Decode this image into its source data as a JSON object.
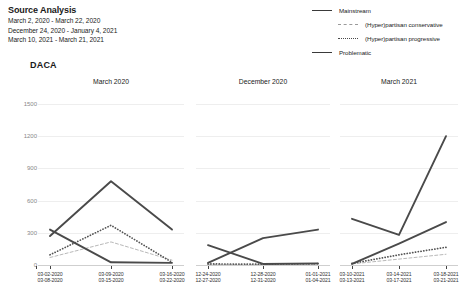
{
  "header": {
    "title": "Source Analysis",
    "date_ranges": [
      "March 2, 2020 - March 22, 2020",
      "December 24, 2020 - January 4, 2021",
      "March 10, 2021 - March 21, 2021"
    ]
  },
  "legend": {
    "items": [
      {
        "label": "Mainstream",
        "style": "solid",
        "color": "#3a3a3a",
        "indent": false
      },
      {
        "label": "(Hyper)partisan conservative",
        "style": "dash",
        "color": "#9a9a9a",
        "indent": true
      },
      {
        "label": "(Hyper)partisan progressive",
        "style": "dot",
        "color": "#4a4a4a",
        "indent": true
      },
      {
        "label": "Problematic",
        "style": "solid",
        "color": "#3a3a3a",
        "indent": false
      }
    ]
  },
  "chart_data": {
    "type": "line",
    "title": "DACA",
    "xlabel": "",
    "ylabel": "",
    "ylim": [
      0,
      1500
    ],
    "yticks": [
      0,
      300,
      600,
      900,
      1200,
      1500
    ],
    "grid": true,
    "legend_position": "top-right",
    "panels": [
      {
        "title": "March 2020",
        "x": [
          "03-02-2020\n03-08-2020",
          "03-09-2020\n03-15-2020",
          "03-16-2020\n03-22-2020"
        ],
        "xticks": [
          {
            "line1": "03-02-2020",
            "line2": "03-08-2020"
          },
          {
            "line1": "03-09-2020",
            "line2": "03-15-2020"
          },
          {
            "line1": "03-16-2020",
            "line2": "03-22-2020"
          }
        ],
        "series": [
          {
            "name": "Mainstream",
            "style": "solid",
            "color": "#4a4a4a",
            "values": [
              270,
              780,
              330
            ]
          },
          {
            "name": "(Hyper)partisan conservative",
            "style": "dash",
            "color": "#b0b0b0",
            "values": [
              70,
              215,
              45
            ]
          },
          {
            "name": "(Hyper)partisan progressive",
            "style": "dot",
            "color": "#555555",
            "values": [
              95,
              370,
              25
            ]
          },
          {
            "name": "Problematic",
            "style": "solid",
            "color": "#4a4a4a",
            "values": [
              330,
              25,
              20
            ]
          }
        ]
      },
      {
        "title": "December 2020",
        "x": [
          "12-24-2020\n12-27-2020",
          "12-28-2020\n12-31-2020",
          "01-01-2021\n01-04-2021"
        ],
        "xticks": [
          {
            "line1": "12-24-2020",
            "line2": "12-27-2020"
          },
          {
            "line1": "12-28-2020",
            "line2": "12-31-2020"
          },
          {
            "line1": "01-01-2021",
            "line2": "01-04-2021"
          }
        ],
        "series": [
          {
            "name": "Mainstream",
            "style": "solid",
            "color": "#4a4a4a",
            "values": [
              20,
              250,
              330
            ]
          },
          {
            "name": "(Hyper)partisan conservative",
            "style": "dash",
            "color": "#b0b0b0",
            "values": [
              5,
              5,
              5
            ]
          },
          {
            "name": "(Hyper)partisan progressive",
            "style": "dot",
            "color": "#555555",
            "values": [
              10,
              8,
              12
            ]
          },
          {
            "name": "Problematic",
            "style": "solid",
            "color": "#4a4a4a",
            "values": [
              185,
              10,
              15
            ]
          }
        ]
      },
      {
        "title": "March 2021",
        "x": [
          "03-10-2021\n03-13-2021",
          "03-14-2021\n03-17-2021",
          "03-18-2021\n03-21-2021"
        ],
        "xticks": [
          {
            "line1": "03-10-2021",
            "line2": "03-13-2021"
          },
          {
            "line1": "03-14-2021",
            "line2": "03-17-2021"
          },
          {
            "line1": "03-18-2021",
            "line2": "03-21-2021"
          }
        ],
        "series": [
          {
            "name": "Mainstream",
            "style": "solid",
            "color": "#4a4a4a",
            "values": [
              430,
              280,
              1200
            ]
          },
          {
            "name": "(Hyper)partisan conservative",
            "style": "dash",
            "color": "#b0b0b0",
            "values": [
              10,
              55,
              100
            ]
          },
          {
            "name": "(Hyper)partisan progressive",
            "style": "dot",
            "color": "#555555",
            "values": [
              15,
              95,
              165
            ]
          },
          {
            "name": "Problematic",
            "style": "solid",
            "color": "#4a4a4a",
            "values": [
              10,
              200,
              400
            ]
          }
        ]
      }
    ]
  }
}
